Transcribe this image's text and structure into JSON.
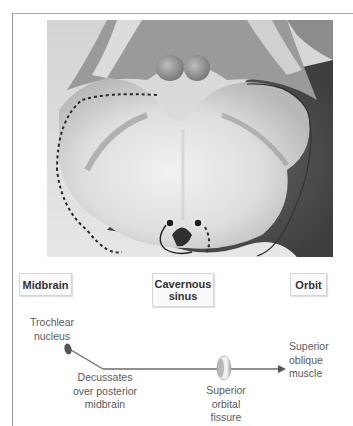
{
  "figure": {
    "photo_description": "Axial section of midbrain with dashed outline tracing the trochlear nerve course",
    "regions": [
      {
        "id": "midbrain",
        "label": "Midbrain"
      },
      {
        "id": "cavernous-sinus",
        "label": "Cavernous sinus",
        "lines": [
          "Cavernous",
          "sinus"
        ]
      },
      {
        "id": "orbit",
        "label": "Orbit"
      }
    ],
    "pathway": {
      "origin": {
        "lines": [
          "Trochlear",
          "nucleus"
        ]
      },
      "decussation": {
        "lines": [
          "Decussates",
          "over posterior",
          "midbrain"
        ]
      },
      "passage": {
        "lines": [
          "Superior",
          "orbital",
          "fissure"
        ]
      },
      "target": {
        "lines": [
          "Superior",
          "oblique",
          "muscle"
        ]
      }
    },
    "colors": {
      "line": "#6b6b6b",
      "nucleus": "#555555",
      "box_border": "#d6d6d6",
      "label_text": "#5a5a5a",
      "box_text": "#333333"
    }
  }
}
